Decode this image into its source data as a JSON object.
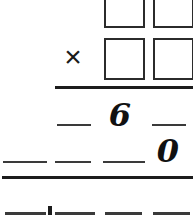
{
  "worksheet": {
    "type": "long-multiplication",
    "operator": "×",
    "background_color": "#ffffff",
    "ink_color": "#1c1c1c",
    "answer_boxes": [
      {
        "id": "multiplicand-tens",
        "row": 1,
        "column": 1,
        "value": ""
      },
      {
        "id": "multiplicand-ones",
        "row": 1,
        "column": 2,
        "value": ""
      },
      {
        "id": "multiplier-tens",
        "row": 2,
        "column": 1,
        "value": ""
      },
      {
        "id": "multiplier-ones",
        "row": 2,
        "column": 2,
        "value": ""
      }
    ],
    "partial_product_row": {
      "blanks": 2,
      "digits": [
        {
          "id": "partial-product-digit-6",
          "value": "6"
        }
      ]
    },
    "second_partial_row": {
      "blanks": 3,
      "digits": [
        {
          "id": "second-partial-digit-0",
          "value": "0"
        }
      ]
    },
    "total_row": {
      "blanks": 4,
      "decimal_point": true
    },
    "rules": [
      {
        "id": "product-rule",
        "label": "multiply-rule"
      },
      {
        "id": "sum-rule",
        "label": "sum-rule"
      }
    ]
  }
}
